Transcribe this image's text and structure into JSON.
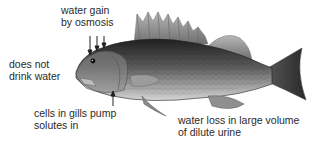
{
  "diagram": {
    "labels": {
      "water_gain": {
        "line1": "water gain",
        "line2": "by osmosis"
      },
      "no_drink": {
        "line1": "does not",
        "line2": "drink water"
      },
      "gills": {
        "line1": "cells in gills pump",
        "line2": "solutes in"
      },
      "urine": {
        "line1": "water loss in large volume",
        "line2": "of dilute urine"
      }
    },
    "arrows": {
      "water_gain_count": 3,
      "gills_count": 1
    },
    "colors": {
      "background": "#ffffff",
      "text": "#2a2a2a",
      "fish_dark": "#2b2b2b",
      "fish_mid": "#6a6a6a",
      "fish_light": "#c8c8c8",
      "fin": "#9a9a9a"
    }
  }
}
